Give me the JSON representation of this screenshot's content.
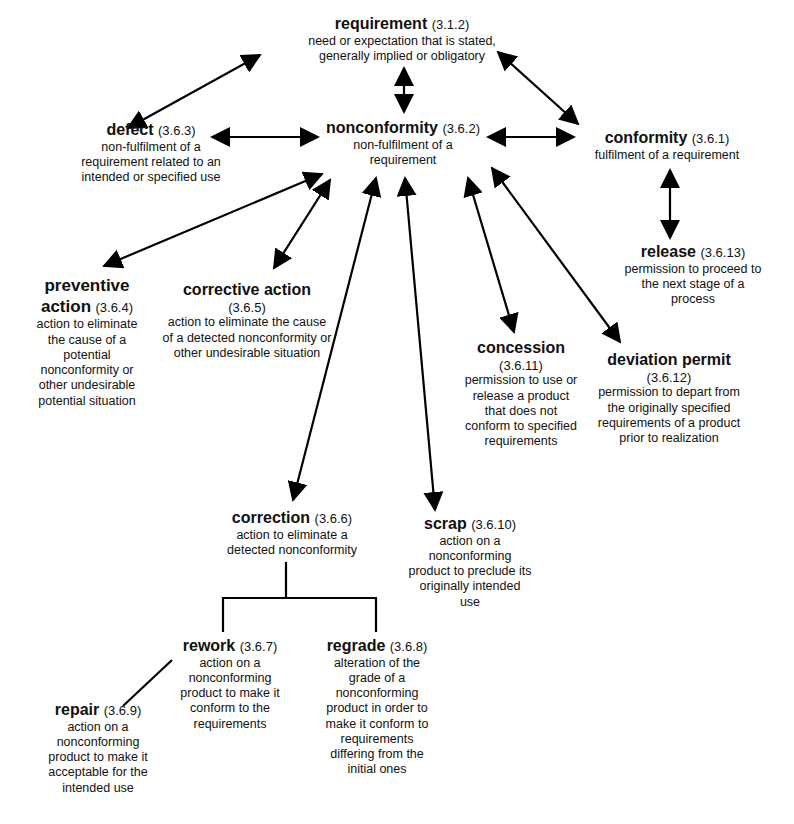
{
  "diagram": {
    "nodes": {
      "requirement": {
        "term": "requirement",
        "ref": "(3.1.2)",
        "def": "need or expectation that is stated, generally implied or obligatory"
      },
      "defect": {
        "term": "defect",
        "ref": "(3.6.3)",
        "def": "non-fulfilment of a requirement related to an intended or specified use"
      },
      "nonconformity": {
        "term": "nonconformity",
        "ref": "(3.6.2)",
        "def": "non-fulfilment of a requirement"
      },
      "conformity": {
        "term": "conformity",
        "ref": "(3.6.1)",
        "def": "fulfilment of a requirement"
      },
      "release": {
        "term": "release",
        "ref": "(3.6.13)",
        "def": "permission to proceed to the next stage of a process"
      },
      "preventive_action": {
        "term": "preventive action",
        "ref": "(3.6.4)",
        "def": "action to eliminate the cause of a potential nonconformity or other undesirable potential situation"
      },
      "corrective_action": {
        "term": "corrective action",
        "ref": "(3.6.5)",
        "def": "action to eliminate the cause of a detected nonconformity or other undesirable situation"
      },
      "concession": {
        "term": "concession",
        "ref": "(3.6.11)",
        "def": "permission to use or release a product that does not conform to specified requirements"
      },
      "deviation_permit": {
        "term": "deviation permit",
        "ref": "(3.6.12)",
        "def": "permission to depart from the originally specified requirements of a product prior to realization"
      },
      "correction": {
        "term": "correction",
        "ref": "(3.6.6)",
        "def": "action to eliminate a detected nonconformity"
      },
      "scrap": {
        "term": "scrap",
        "ref": "(3.6.10)",
        "def": "action on a nonconforming product to preclude its originally intended use"
      },
      "rework": {
        "term": "rework",
        "ref": "(3.6.7)",
        "def": "action on a nonconforming product to make it conform to  the requirements"
      },
      "regrade": {
        "term": "regrade",
        "ref": "(3.6.8)",
        "def": "alteration of the grade of a nonconforming product in order to make it conform to requirements differing from the initial ones"
      },
      "repair": {
        "term": "repair",
        "ref": "(3.6.9)",
        "def": "action on a nonconforming product to make it acceptable for the intended use"
      }
    },
    "edges": [
      {
        "from": "requirement",
        "to": "defect",
        "type": "double-arrow"
      },
      {
        "from": "requirement",
        "to": "nonconformity",
        "type": "double-arrow"
      },
      {
        "from": "requirement",
        "to": "conformity",
        "type": "double-arrow"
      },
      {
        "from": "defect",
        "to": "nonconformity",
        "type": "double-arrow"
      },
      {
        "from": "nonconformity",
        "to": "conformity",
        "type": "double-arrow"
      },
      {
        "from": "conformity",
        "to": "release",
        "type": "double-arrow"
      },
      {
        "from": "nonconformity",
        "to": "preventive_action",
        "type": "double-arrow"
      },
      {
        "from": "nonconformity",
        "to": "corrective_action",
        "type": "double-arrow"
      },
      {
        "from": "nonconformity",
        "to": "correction",
        "type": "double-arrow"
      },
      {
        "from": "nonconformity",
        "to": "scrap",
        "type": "double-arrow"
      },
      {
        "from": "nonconformity",
        "to": "concession",
        "type": "double-arrow"
      },
      {
        "from": "nonconformity",
        "to": "deviation_permit",
        "type": "double-arrow"
      },
      {
        "from": "correction",
        "to": "rework",
        "type": "tree-line"
      },
      {
        "from": "correction",
        "to": "regrade",
        "type": "tree-line"
      },
      {
        "from": "rework",
        "to": "repair",
        "type": "line"
      }
    ]
  }
}
